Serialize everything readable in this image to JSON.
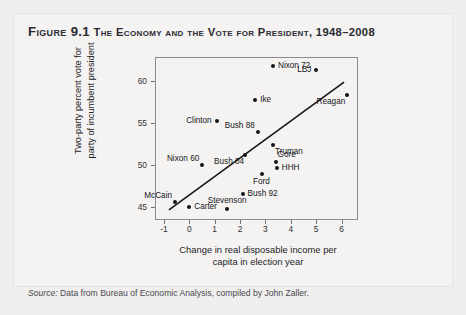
{
  "figure": {
    "number": "Figure 9.1",
    "title": "The Economy and the Vote for President, 1948–2008",
    "source_label": "Source:",
    "source_text": " Data from Bureau of Economic Analysis, compiled by John Zaller."
  },
  "chart_data": {
    "type": "scatter",
    "title": "The Economy and the Vote for President, 1948–2008",
    "xlabel": "Change in real disposable income per capita in election year",
    "xlabel_line1": "Change in real disposable income per",
    "xlabel_line2": "capita in election year",
    "ylabel": "Two-party percent vote for party of incumbent president",
    "ylabel_line1": "Two-party percent vote for",
    "ylabel_line2": "party of incumbent president",
    "xlim": [
      -1.35,
      6.65
    ],
    "ylim": [
      43.4,
      62.9
    ],
    "xticks": [
      -1,
      0,
      1,
      2,
      3,
      4,
      5,
      6
    ],
    "yticks": [
      45,
      50,
      55,
      60
    ],
    "grid": false,
    "legend": "none",
    "point_color": "#16161a",
    "line_color": "#16161a",
    "trendline": {
      "x0": -0.8,
      "y0": 44.6,
      "x1": 6.1,
      "y1": 59.9
    },
    "points": [
      {
        "label": "McCain",
        "x": -0.55,
        "y": 45.6,
        "label_pos": "above-left"
      },
      {
        "label": "Carter",
        "x": 0.0,
        "y": 44.9,
        "label_pos": "right"
      },
      {
        "label": "Nixon 60",
        "x": 0.5,
        "y": 50.0,
        "label_pos": "above-left"
      },
      {
        "label": "Clinton",
        "x": 1.1,
        "y": 55.2,
        "label_pos": "left"
      },
      {
        "label": "Stevenson",
        "x": 1.5,
        "y": 44.7,
        "label_pos": "above"
      },
      {
        "label": "Bush 92",
        "x": 2.1,
        "y": 46.5,
        "label_pos": "right"
      },
      {
        "label": "Bush 04",
        "x": 2.2,
        "y": 51.2,
        "label_pos": "below-left"
      },
      {
        "label": "Ike",
        "x": 2.6,
        "y": 57.7,
        "label_pos": "right"
      },
      {
        "label": "Bush 88",
        "x": 2.7,
        "y": 53.9,
        "label_pos": "above-left"
      },
      {
        "label": "Ford",
        "x": 2.85,
        "y": 48.9,
        "label_pos": "below"
      },
      {
        "label": "Nixon 72",
        "x": 3.3,
        "y": 61.8,
        "label_pos": "right"
      },
      {
        "label": "Truman",
        "x": 3.3,
        "y": 52.4,
        "label_pos": "below-right"
      },
      {
        "label": "Gore",
        "x": 3.4,
        "y": 50.3,
        "label_pos": "above-right"
      },
      {
        "label": "HHH",
        "x": 3.45,
        "y": 49.6,
        "label_pos": "right"
      },
      {
        "label": "LBJ",
        "x": 5.0,
        "y": 61.3,
        "label_pos": "left"
      },
      {
        "label": "Reagan",
        "x": 6.2,
        "y": 58.3,
        "label_pos": "below-left"
      }
    ]
  }
}
